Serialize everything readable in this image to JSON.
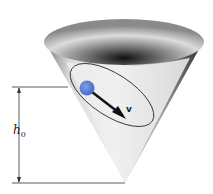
{
  "diagram": {
    "labels": {
      "velocity": "v",
      "height_symbol": "h",
      "height_subscript": "0"
    },
    "colors": {
      "ball": "#5a7fd6",
      "cone_dark": "#1a1a1a",
      "cone_light": "#f2f2f2",
      "lines": "#333333"
    }
  }
}
